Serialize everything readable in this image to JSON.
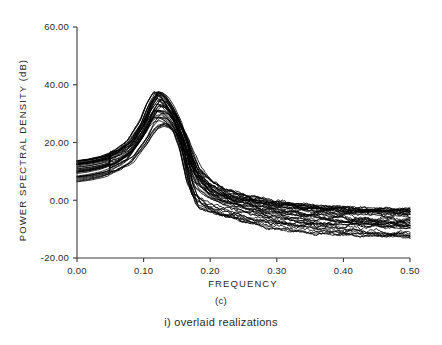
{
  "figure": {
    "caption_panel": "(c)",
    "caption_sub": "i) overlaid realizations"
  },
  "chart_data": {
    "type": "line",
    "title": "",
    "subtitle": "",
    "xlabel": "FREQUENCY",
    "ylabel": "POWER SPECTRAL DENSITY (dB)",
    "xlim": [
      0.0,
      0.5
    ],
    "ylim": [
      -20.0,
      60.0
    ],
    "xticks": [
      0.0,
      0.1,
      0.2,
      0.3,
      0.4,
      0.5
    ],
    "xtick_labels": [
      "0.00",
      "0.10",
      "0.20",
      "0.30",
      "0.40",
      "0.50"
    ],
    "yticks": [
      -20.0,
      0.0,
      20.0,
      40.0,
      60.0
    ],
    "ytick_labels": [
      "-20.00",
      "0.00",
      "20.00",
      "40.00",
      "60.00"
    ],
    "grid": false,
    "legend": null,
    "legend_position": "none",
    "n_realizations": 40,
    "series_description": "overlaid power spectral density estimates of repeated realizations",
    "annotations": [
      "(c)",
      "i) overlaid realizations"
    ],
    "envelope": {
      "x": [
        0.0,
        0.02,
        0.04,
        0.06,
        0.08,
        0.1,
        0.11,
        0.12,
        0.13,
        0.14,
        0.15,
        0.16,
        0.17,
        0.18,
        0.2,
        0.22,
        0.24,
        0.26,
        0.28,
        0.3,
        0.34,
        0.38,
        0.42,
        0.46,
        0.5
      ],
      "upper": [
        14.0,
        14.6,
        15.6,
        17.4,
        20.6,
        28.0,
        34.0,
        38.0,
        36.5,
        33.0,
        28.5,
        23.0,
        17.0,
        12.0,
        6.5,
        4.0,
        2.5,
        1.5,
        0.5,
        -0.2,
        -1.2,
        -1.8,
        -2.2,
        -2.6,
        -2.8
      ],
      "lower": [
        6.0,
        6.6,
        7.6,
        9.2,
        12.0,
        17.5,
        21.0,
        23.5,
        24.5,
        24.0,
        22.0,
        15.0,
        2.0,
        -3.5,
        -5.5,
        -6.5,
        -7.5,
        -8.5,
        -9.5,
        -10.2,
        -11.4,
        -12.0,
        -12.4,
        -12.7,
        -13.0
      ]
    },
    "peak": {
      "frequency": 0.12,
      "value_db": 38.0
    },
    "baseline_low_freq_db": [
      6.0,
      14.0
    ],
    "tail_high_freq_db": [
      -13.0,
      -2.8
    ]
  }
}
